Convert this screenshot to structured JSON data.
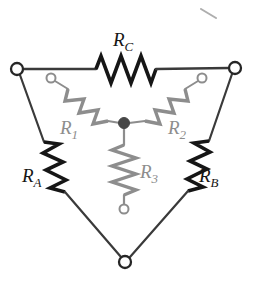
{
  "colors": {
    "background": "#ffffff",
    "delta_stroke": "#161616",
    "wye_stroke": "#8d8d8d",
    "wire_stroke": "#3a3a3a",
    "center_node_fill": "#474747",
    "terminal_fill": "#ffffff"
  },
  "labels": {
    "delta": [
      {
        "name": "R_A",
        "base": "R",
        "sub": "A",
        "x": 22,
        "y": 182,
        "color": "#161616"
      },
      {
        "name": "R_B",
        "base": "R",
        "sub": "B",
        "x": 199,
        "y": 182,
        "color": "#161616"
      },
      {
        "name": "R_C",
        "base": "R",
        "sub": "C",
        "x": 113,
        "y": 46,
        "color": "#161616"
      }
    ],
    "wye": [
      {
        "name": "R_1",
        "base": "R",
        "sub": "1",
        "x": 60,
        "y": 134,
        "color": "#8d8d8d"
      },
      {
        "name": "R_2",
        "base": "R",
        "sub": "2",
        "x": 168,
        "y": 134,
        "color": "#8d8d8d"
      },
      {
        "name": "R_3",
        "base": "R",
        "sub": "3",
        "x": 140,
        "y": 178,
        "color": "#8d8d8d"
      }
    ]
  },
  "terminals": {
    "delta": [
      {
        "name": "left-vertex-terminal",
        "cx": 17,
        "cy": 69,
        "r": 6
      },
      {
        "name": "right-vertex-terminal",
        "cx": 235,
        "cy": 68,
        "r": 6
      },
      {
        "name": "bottom-vertex-terminal",
        "cx": 125,
        "cy": 262,
        "r": 6
      }
    ],
    "wye": [
      {
        "name": "wye-terminal-1",
        "cx": 51,
        "cy": 78,
        "r": 4.5
      },
      {
        "name": "wye-terminal-2",
        "cx": 202,
        "cy": 78,
        "r": 4.5
      },
      {
        "name": "wye-terminal-3",
        "cx": 124,
        "cy": 209,
        "r": 4.5
      }
    ]
  },
  "center_node": {
    "name": "wye-center-node",
    "cx": 124,
    "cy": 123,
    "r": 5.5
  },
  "artifact": {
    "name": "scan-artifact-mark",
    "x1": 201,
    "y1": 9,
    "x2": 216,
    "y2": 18
  }
}
